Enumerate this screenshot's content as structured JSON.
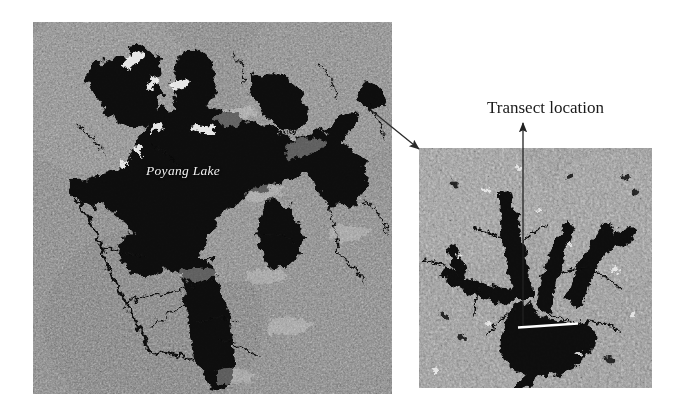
{
  "figure": {
    "background_color": "#ffffff",
    "caption_present": false
  },
  "overview_image": {
    "name": "poyang-lake-overview",
    "alt": "Grayscale satellite radar image of Poyang Lake region",
    "label": "Poyang Lake",
    "label_color": "#f2f2f2",
    "label_style": "italic",
    "water_color": "#0a0a0a",
    "land_color": "#8c8c8c",
    "bright_color": "#f0f0f0",
    "bounds": {
      "x": 33,
      "y": 22,
      "width": 359,
      "height": 372
    }
  },
  "detail_image": {
    "name": "transect-detail-inset",
    "alt": "Zoomed grayscale satellite detail of dendritic lake arm",
    "water_color": "#0a0a0a",
    "land_color": "#9a9a9a",
    "bright_color": "#efefef",
    "bounds": {
      "x": 419,
      "y": 148,
      "width": 233,
      "height": 240
    }
  },
  "annotations": {
    "transect_label": "Transect location",
    "transect_label_color": "#1a1a1a",
    "transect_line_color": "#ffffff",
    "pointer_color": "#2b2b2b",
    "zoom_connector": {
      "from": {
        "x": 372,
        "y": 111
      },
      "to": {
        "x": 421,
        "y": 150
      }
    },
    "transect_arrow": {
      "from": {
        "x": 523,
        "y": 327
      },
      "to": {
        "x": 523,
        "y": 124
      }
    },
    "transect_line": {
      "x1": 518,
      "y1": 327,
      "x2": 578,
      "y2": 323
    }
  }
}
